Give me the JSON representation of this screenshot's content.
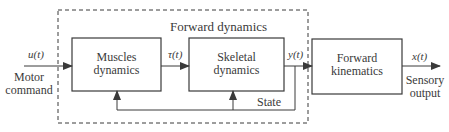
{
  "diagram": {
    "group": {
      "title": "Forward dynamics"
    },
    "blocks": [
      {
        "id": "muscles",
        "line1": "Muscles",
        "line2": "dynamics"
      },
      {
        "id": "skeletal",
        "line1": "Skeletal",
        "line2": "dynamics"
      },
      {
        "id": "kinematics",
        "line1": "Forward",
        "line2": "kinematics"
      }
    ],
    "signals": {
      "input": "u(t)",
      "torque": "τ(t)",
      "state_output": "y(t)",
      "output": "x(t)",
      "feedback": "State"
    },
    "annotations": {
      "input_line1": "Motor",
      "input_line2": "command",
      "output_line1": "Sensory",
      "output_line2": "output"
    },
    "colors": {
      "stroke": "#3a3a3a",
      "background": "#ffffff"
    }
  }
}
